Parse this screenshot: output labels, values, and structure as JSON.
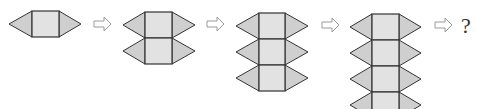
{
  "diagram": {
    "type": "sequence",
    "steps": [
      {
        "label": "step-1",
        "rows": 1
      },
      {
        "label": "step-2",
        "rows": 2
      },
      {
        "label": "step-3",
        "rows": 3
      },
      {
        "label": "step-4",
        "rows": 4
      }
    ],
    "arrow_icon": "hollow-right-arrow",
    "next_label": "?",
    "colors": {
      "triangle_fill": "#cfcfcf",
      "square_fill": "#e2e2e2",
      "stroke": "#333333",
      "arrow_stroke": "#9a9a9a"
    }
  }
}
